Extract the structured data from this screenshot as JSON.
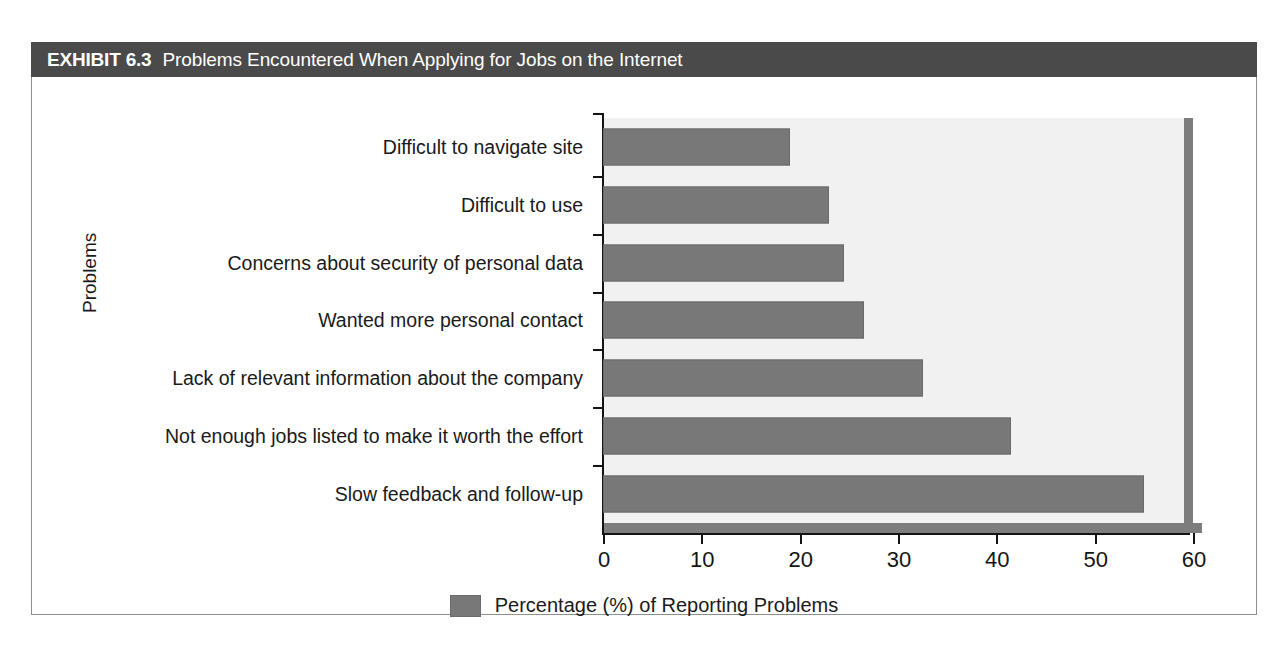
{
  "exhibit": {
    "label": "EXHIBIT 6.3",
    "title": "Problems Encountered When Applying for Jobs on the Internet",
    "header_bg": "#4a4a4a",
    "header_text_color": "#ffffff",
    "frame_border_color": "#8e8e8e"
  },
  "chart_data": {
    "type": "bar",
    "orientation": "horizontal",
    "title": "Problems Encountered When Applying for Jobs on the Internet",
    "xlabel": "",
    "ylabel": "Problems",
    "categories": [
      "Difficult to navigate site",
      "Difficult to use",
      "Concerns about security of personal data",
      "Wanted more personal contact",
      "Lack of relevant information about the company",
      "Not enough jobs listed to make it worth the effort",
      "Slow feedback and follow-up"
    ],
    "values": [
      19,
      23,
      24.5,
      26.5,
      32.5,
      41.5,
      55
    ],
    "series": [
      {
        "name": "Percentage (%) of Reporting Problems",
        "values": [
          19,
          23,
          24.5,
          26.5,
          32.5,
          41.5,
          55
        ],
        "color": "#787878"
      }
    ],
    "xlim": [
      0,
      60
    ],
    "xticks": [
      0,
      10,
      20,
      30,
      40,
      50,
      60
    ],
    "xtick_labels": [
      "0",
      "10",
      "20",
      "30",
      "40",
      "50",
      "60"
    ],
    "grid": false,
    "legend_position": "bottom",
    "legend_entries": [
      "Percentage (%) of Reporting Problems"
    ],
    "plot_background": "#f1f1f1",
    "bar_color": "#787878"
  },
  "legend": {
    "text": "Percentage (%) of Reporting Problems"
  }
}
